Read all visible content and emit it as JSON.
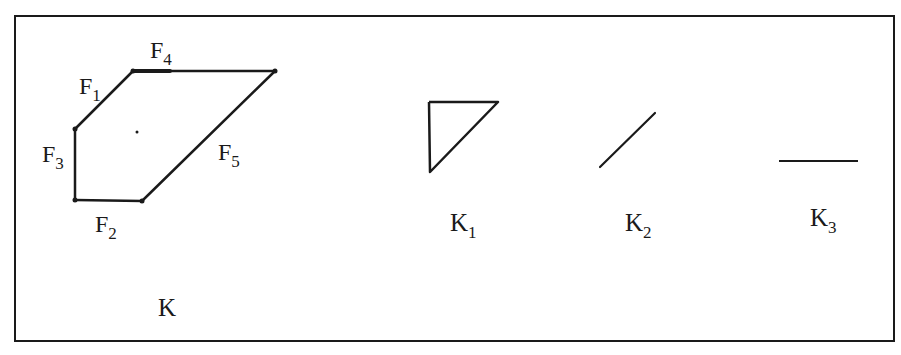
{
  "figure": {
    "frame_color": "#1a1a1a",
    "stroke_color": "#1a1a1a",
    "background": "#ffffff"
  },
  "complex_K": {
    "label": "K",
    "faces": [
      {
        "name": "F",
        "sub": "1"
      },
      {
        "name": "F",
        "sub": "2"
      },
      {
        "name": "F",
        "sub": "3"
      },
      {
        "name": "F",
        "sub": "4"
      },
      {
        "name": "F",
        "sub": "5"
      }
    ]
  },
  "subcomplexes": [
    {
      "name": "K",
      "sub": "1",
      "shape": "triangle"
    },
    {
      "name": "K",
      "sub": "2",
      "shape": "diagonal-segment"
    },
    {
      "name": "K",
      "sub": "3",
      "shape": "horizontal-segment"
    }
  ]
}
